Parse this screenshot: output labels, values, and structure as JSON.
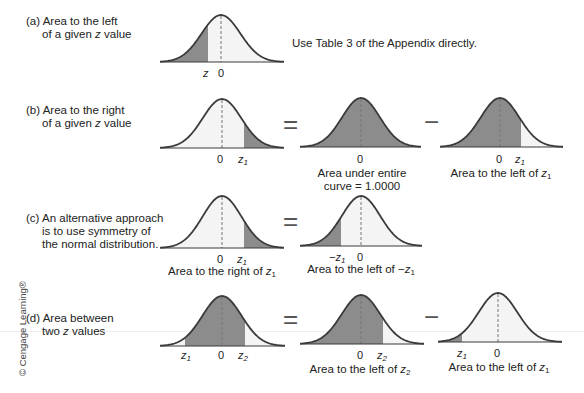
{
  "rows": {
    "a": {
      "label_prefix": "(a)",
      "label_line1": "Area to the left",
      "label_line2_pre": "of a given ",
      "label_line2_var": "z",
      "label_line2_post": " value",
      "note": "Use Table 3 of the Appendix directly."
    },
    "b": {
      "label_prefix": "(b)",
      "label_line1": "Area to the right",
      "label_line2_pre": "of a given ",
      "label_line2_var": "z",
      "label_line2_post": " value",
      "caption_middle_1": "Area under entire",
      "caption_middle_2": "curve = 1.0000",
      "caption_right_pre": "Area to the left of ",
      "caption_right_var": "z",
      "caption_right_sub": "1"
    },
    "c": {
      "label_prefix": "(c)",
      "label_line1": "An alternative approach",
      "label_line2": "is to use symmetry of",
      "label_line3": "the normal distribution.",
      "caption_left_pre": "Area to the right of ",
      "caption_left_var": "z",
      "caption_left_sub": "1",
      "caption_right_pre": "Area to the left of −",
      "caption_right_var": "z",
      "caption_right_sub": "1"
    },
    "d": {
      "label_prefix": "(d)",
      "label_line1": "Area between",
      "label_line2_pre": "two ",
      "label_line2_var": "z",
      "label_line2_post": " values",
      "caption_middle_pre": "Area to the left of ",
      "caption_middle_var": "z",
      "caption_middle_sub": "2",
      "caption_right_pre": "Area to the left of ",
      "caption_right_var": "z",
      "caption_right_sub": "1"
    }
  },
  "ticks": {
    "zero": "0",
    "z": "z",
    "z1_var": "z",
    "z1_sub": "1",
    "z2_var": "z",
    "z2_sub": "2",
    "neg": "−"
  },
  "operators": {
    "equals": "=",
    "minus": "−"
  },
  "credit": "© Cengage Learning®",
  "colors": {
    "shade": "#8c8c8c",
    "unshaded": "#f4f4f4",
    "curve": "#3a3a3a",
    "dash": "#777777"
  }
}
